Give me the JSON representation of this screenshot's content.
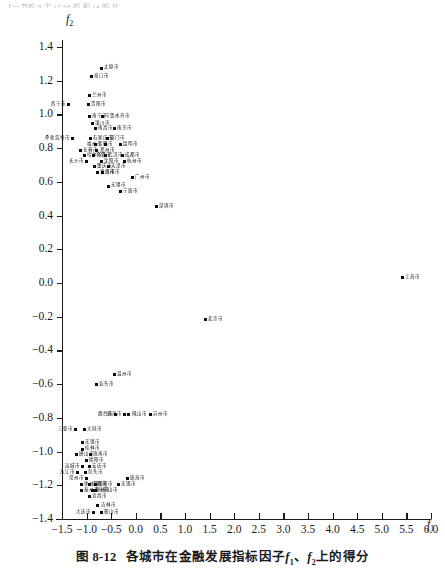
{
  "page": {
    "bleed_text": "上一节的 8 个 17.68 的 和 14 的  比",
    "caption_number": "图 8-12",
    "caption_text_a": "各城市在金融发展指标因子",
    "caption_f1": "f",
    "caption_f1_sub": "1",
    "caption_sep": "、",
    "caption_f2": "f",
    "caption_f2_sub": "2",
    "caption_text_b": "上的得分"
  },
  "chart_data": {
    "type": "scatter",
    "xlabel": "f1",
    "ylabel": "f2",
    "xlim": [
      -1.5,
      6.0
    ],
    "ylim": [
      -1.4,
      1.4
    ],
    "xticks": [
      -1.5,
      -1.0,
      -0.5,
      0.0,
      0.5,
      1.0,
      1.5,
      2.0,
      2.5,
      3.0,
      3.5,
      4.0,
      4.5,
      5.0,
      5.5,
      6.0
    ],
    "xticklabels": [
      "-1.5",
      "-1.0",
      "-0.5",
      "0.0",
      "0.5",
      "1.0",
      "1.5",
      "2.0",
      "2.5",
      "3.0",
      "3.5",
      "4.0",
      "4.5",
      "5.0",
      "5.5",
      "6.0"
    ],
    "yticks": [
      -1.4,
      -1.2,
      -1.0,
      -0.8,
      -0.6,
      -0.4,
      -0.2,
      0.0,
      0.2,
      0.4,
      0.6,
      0.8,
      1.0,
      1.2,
      1.4
    ],
    "yticklabels": [
      "-1.4",
      "-1.2",
      "-1.0",
      "-0.8",
      "-0.6",
      "-0.4",
      "-0.2",
      "0.0",
      "0.2",
      "0.4",
      "0.6",
      "0.8",
      "1.0",
      "1.2",
      "1.4"
    ],
    "grid": false,
    "legend": false,
    "marker": "square",
    "marker_color": "#0d0d0d",
    "points": [
      {
        "label": "太原市",
        "x": -0.7,
        "y": 1.275,
        "side": "right"
      },
      {
        "label": "海口市",
        "x": -0.9,
        "y": 1.225,
        "side": "right"
      },
      {
        "label": "兰州市",
        "x": -0.95,
        "y": 1.11,
        "side": "right"
      },
      {
        "label": "西宁市",
        "x": -1.36,
        "y": 1.06,
        "side": "left"
      },
      {
        "label": "贵阳市",
        "x": -0.97,
        "y": 1.06,
        "side": "right"
      },
      {
        "label": "南宁市",
        "x": -0.95,
        "y": 0.985,
        "side": "right"
      },
      {
        "label": "乌鲁木齐市",
        "x": -0.68,
        "y": 0.985,
        "side": "right"
      },
      {
        "label": "银川市",
        "x": -0.88,
        "y": 0.945,
        "side": "right"
      },
      {
        "label": "南昌市",
        "x": -0.82,
        "y": 0.915,
        "side": "right"
      },
      {
        "label": "南京市",
        "x": -0.43,
        "y": 0.915,
        "side": "right"
      },
      {
        "label": "呼和浩特市",
        "x": -1.28,
        "y": 0.855,
        "side": "left"
      },
      {
        "label": "石家庄市",
        "x": -0.92,
        "y": 0.855,
        "side": "right"
      },
      {
        "label": "厦门市",
        "x": -0.58,
        "y": 0.855,
        "side": "right"
      },
      {
        "label": "合肥市",
        "x": -0.83,
        "y": 0.82,
        "side": "right"
      },
      {
        "label": "福州市",
        "x": -0.62,
        "y": 0.82,
        "side": "left"
      },
      {
        "label": "昆明市",
        "x": -0.32,
        "y": 0.82,
        "side": "right"
      },
      {
        "label": "长春市",
        "x": -1.12,
        "y": 0.785,
        "side": "right"
      },
      {
        "label": "郑州市",
        "x": -0.79,
        "y": 0.785,
        "side": "right"
      },
      {
        "label": "哈尔滨市",
        "x": -1.05,
        "y": 0.755,
        "side": "right"
      },
      {
        "label": "乌鲁市",
        "x": -0.86,
        "y": 0.755,
        "side": "right"
      },
      {
        "label": "武汉市",
        "x": -0.62,
        "y": 0.755,
        "side": "right"
      },
      {
        "label": "成都市",
        "x": -0.28,
        "y": 0.755,
        "side": "right"
      },
      {
        "label": "长沙市",
        "x": -1.0,
        "y": 0.72,
        "side": "left"
      },
      {
        "label": "沈阳市",
        "x": -0.7,
        "y": 0.72,
        "side": "right"
      },
      {
        "label": "杭州市",
        "x": -0.23,
        "y": 0.72,
        "side": "right"
      },
      {
        "label": "重庆市",
        "x": -0.84,
        "y": 0.69,
        "side": "right"
      },
      {
        "label": "天津市",
        "x": -0.56,
        "y": 0.69,
        "side": "right"
      },
      {
        "label": "青岛市",
        "x": -0.78,
        "y": 0.655,
        "side": "right"
      },
      {
        "label": "济南市",
        "x": -0.68,
        "y": 0.655,
        "side": "right"
      },
      {
        "label": "广州市",
        "x": -0.06,
        "y": 0.625,
        "side": "right"
      },
      {
        "label": "无锡市",
        "x": -0.55,
        "y": 0.575,
        "side": "right"
      },
      {
        "label": "宁波市",
        "x": -0.32,
        "y": 0.545,
        "side": "right"
      },
      {
        "label": "深圳市",
        "x": 0.42,
        "y": 0.455,
        "side": "right"
      },
      {
        "label": "上海市",
        "x": 5.42,
        "y": 0.03,
        "side": "right"
      },
      {
        "label": "北京市",
        "x": 1.42,
        "y": -0.215,
        "side": "right"
      },
      {
        "label": "温州市",
        "x": -0.44,
        "y": -0.545,
        "side": "right"
      },
      {
        "label": "汕头市",
        "x": -0.8,
        "y": -0.6,
        "side": "right"
      },
      {
        "label": "烟台市",
        "x": -0.41,
        "y": -0.78,
        "side": "left"
      },
      {
        "label": "珠海市",
        "x": -0.23,
        "y": -0.78,
        "side": "left"
      },
      {
        "label": "佛山市",
        "x": -0.14,
        "y": -0.78,
        "side": "right"
      },
      {
        "label": "苏州市",
        "x": 0.29,
        "y": -0.78,
        "side": "right"
      },
      {
        "label": "三亚市",
        "x": -1.22,
        "y": -0.87,
        "side": "left"
      },
      {
        "label": "大同市",
        "x": -1.05,
        "y": -0.87,
        "side": "right"
      },
      {
        "label": "无锡市",
        "x": -1.08,
        "y": -0.945,
        "side": "right"
      },
      {
        "label": "桂林市",
        "x": -1.08,
        "y": -0.985,
        "side": "right"
      },
      {
        "label": "唐山市",
        "x": -1.2,
        "y": -1.02,
        "side": "right"
      },
      {
        "label": "淮南市",
        "x": -0.93,
        "y": -1.02,
        "side": "right"
      },
      {
        "label": "德阳市",
        "x": -1.0,
        "y": -1.055,
        "side": "right"
      },
      {
        "label": "运城市",
        "x": -1.08,
        "y": -1.09,
        "side": "left"
      },
      {
        "label": "安庆市",
        "x": -0.95,
        "y": -1.09,
        "side": "right"
      },
      {
        "label": "九江市",
        "x": -1.18,
        "y": -1.125,
        "side": "left"
      },
      {
        "label": "包头市",
        "x": -1.02,
        "y": -1.125,
        "side": "right"
      },
      {
        "label": "常州市",
        "x": -1.0,
        "y": -1.16,
        "side": "left"
      },
      {
        "label": "珠海市",
        "x": -0.17,
        "y": -1.16,
        "side": "right"
      },
      {
        "label": "徐州市",
        "x": -1.1,
        "y": -1.195,
        "side": "right"
      },
      {
        "label": "洛阳市",
        "x": -0.95,
        "y": -1.195,
        "side": "right"
      },
      {
        "label": "绵阳市",
        "x": -0.82,
        "y": -1.195,
        "side": "right"
      },
      {
        "label": "无锡市",
        "x": -0.36,
        "y": -1.195,
        "side": "right"
      },
      {
        "label": "泰州市",
        "x": -1.1,
        "y": -1.23,
        "side": "right"
      },
      {
        "label": "株洲市",
        "x": -0.88,
        "y": -1.23,
        "side": "right"
      },
      {
        "label": "马鞍山市",
        "x": -0.82,
        "y": -1.23,
        "side": "right"
      },
      {
        "label": "宜昌市",
        "x": -0.94,
        "y": -1.265,
        "side": "right"
      },
      {
        "label": "吉林市",
        "x": -0.77,
        "y": -1.32,
        "side": "right"
      },
      {
        "label": "大庆市",
        "x": -0.86,
        "y": -1.36,
        "side": "left"
      },
      {
        "label": "鞍山市",
        "x": -0.7,
        "y": -1.36,
        "side": "right"
      }
    ]
  }
}
